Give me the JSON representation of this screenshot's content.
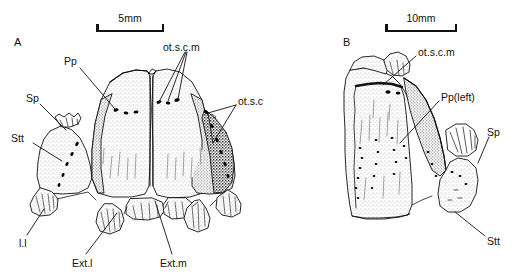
{
  "figure": {
    "width": 522,
    "height": 276,
    "background": "#ffffff",
    "ink_color": "#111111",
    "type": "scientific-line-drawing"
  },
  "panels": [
    {
      "id": "A",
      "letter": "A",
      "letter_x": 14,
      "letter_y": 36,
      "scalebar": {
        "label": "5mm",
        "x": 96,
        "y": 12,
        "width": 68,
        "height": 20
      },
      "annotations": [
        {
          "key": "pp",
          "label": "Pp",
          "x": 64,
          "y": 56,
          "anchor_x": 80,
          "anchor_y": 68,
          "tip_x": 115,
          "tip_y": 109
        },
        {
          "key": "sp",
          "label": "Sp",
          "x": 26,
          "y": 93,
          "anchor_x": 40,
          "anchor_y": 104,
          "tip_x": 66,
          "tip_y": 130
        },
        {
          "key": "stt",
          "label": "Stt",
          "x": 11,
          "y": 133,
          "anchor_x": 33,
          "anchor_y": 143,
          "tip_x": 62,
          "tip_y": 161
        },
        {
          "key": "otscm",
          "label": "ot.s.c.m",
          "x": 163,
          "y": 42,
          "anchor_x": 185,
          "anchor_y": 52,
          "tip_x": 159,
          "tip_y": 102
        },
        {
          "key": "otsc",
          "label": "ot.s.c",
          "x": 238,
          "y": 96,
          "anchor_x": 236,
          "anchor_y": 105,
          "tip_x": 208,
          "tip_y": 114
        },
        {
          "key": "ll",
          "label": "l.l",
          "x": 19,
          "y": 238,
          "anchor_x": 27,
          "anchor_y": 236,
          "tip_x": 44,
          "tip_y": 209
        },
        {
          "key": "extl",
          "label": "Ext.l",
          "x": 72,
          "y": 258,
          "anchor_x": 86,
          "anchor_y": 254,
          "tip_x": 117,
          "tip_y": 213
        },
        {
          "key": "extm",
          "label": "Ext.m",
          "x": 160,
          "y": 258,
          "anchor_x": 172,
          "anchor_y": 254,
          "tip_x": 155,
          "tip_y": 201
        }
      ]
    },
    {
      "id": "B",
      "letter": "B",
      "letter_x": 343,
      "letter_y": 36,
      "scalebar": {
        "label": "10mm",
        "x": 385,
        "y": 12,
        "width": 72,
        "height": 20
      },
      "annotations": [
        {
          "key": "otscm_b",
          "label": "ot.s.c.m",
          "x": 418,
          "y": 47,
          "anchor_x": 416,
          "anchor_y": 56,
          "tip_x": 383,
          "tip_y": 85
        },
        {
          "key": "pp_left",
          "label": "Pp(left)",
          "x": 441,
          "y": 92,
          "anchor_x": 440,
          "anchor_y": 101,
          "tip_x": 400,
          "tip_y": 143
        },
        {
          "key": "sp_b",
          "label": "Sp",
          "x": 487,
          "y": 127,
          "anchor_x": 489,
          "anchor_y": 137,
          "tip_x": 478,
          "tip_y": 163
        },
        {
          "key": "stt_b",
          "label": "Stt",
          "x": 487,
          "y": 236,
          "anchor_x": 485,
          "anchor_y": 236,
          "tip_x": 455,
          "tip_y": 212
        }
      ]
    }
  ],
  "legend_keys": {
    "Pp": "paroccipital process",
    "Sp": "sphenoid region",
    "Stt": "supratemporal",
    "ot.s.c": "otic suture canal",
    "ot.s.c.m": "otic suture canal margin",
    "l.l": "lateral lamina",
    "Ext.l": "external lateral",
    "Ext.m": "external medial"
  }
}
